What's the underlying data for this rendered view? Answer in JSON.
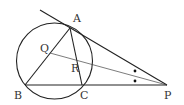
{
  "diagram": {
    "stroke_color": "#222222",
    "circle": {
      "cx": 54.5,
      "cy": 61,
      "r": 38
    },
    "points": {
      "A": {
        "label": "A",
        "x": 70,
        "y": 28,
        "lx": 73,
        "ly": 22
      },
      "B": {
        "label": "B",
        "x": 25,
        "y": 85,
        "lx": 14,
        "ly": 99
      },
      "C": {
        "label": "C",
        "x": 82,
        "y": 85,
        "lx": 80,
        "ly": 99
      },
      "P": {
        "label": "P",
        "x": 167,
        "y": 85,
        "lx": 164,
        "ly": 99
      },
      "Q": {
        "label": "Q",
        "x": 50,
        "y": 53,
        "lx": 40,
        "ly": 52
      },
      "R": {
        "label": "R",
        "x": 78,
        "y": 67,
        "lx": 71,
        "ly": 72
      }
    },
    "tangent_start": {
      "x": 40,
      "y": 10
    },
    "angle_marks": [
      {
        "x": 135,
        "y": 71
      },
      {
        "x": 135,
        "y": 81
      }
    ]
  }
}
